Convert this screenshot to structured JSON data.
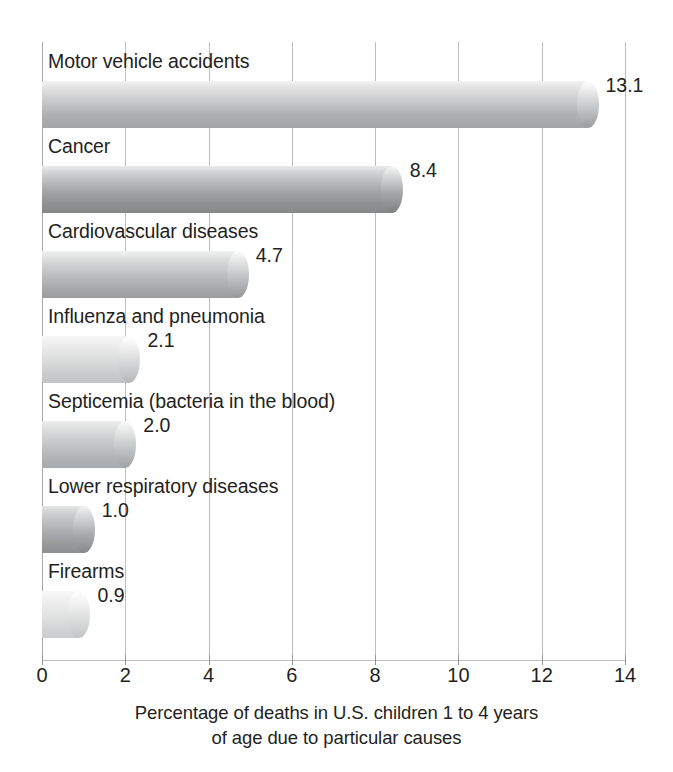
{
  "chart_data": {
    "type": "bar",
    "orientation": "horizontal",
    "title": "",
    "subtitle": "",
    "xlabel_line1": "Percentage of deaths in U.S. children 1 to 4 years",
    "xlabel_line2": "of age due to particular causes",
    "ylabel": "",
    "xlim": [
      0,
      14
    ],
    "xticks": [
      0,
      2,
      4,
      6,
      8,
      10,
      12,
      14
    ],
    "xtick_labels": [
      "0",
      "2",
      "4",
      "6",
      "8",
      "10",
      "12",
      "14"
    ],
    "grid": "vertical",
    "legend": "none",
    "categories": [
      "Motor vehicle accidents",
      "Cancer",
      "Cardiovascular diseases",
      "Influenza and pneumonia",
      "Septicemia (bacteria in the blood)",
      "Lower respiratory diseases",
      "Firearms"
    ],
    "values": [
      13.1,
      8.4,
      4.7,
      2.1,
      2.0,
      1.0,
      0.9
    ],
    "value_labels": [
      "13.1",
      "8.4",
      "4.7",
      "2.1",
      "2.0",
      "1.0",
      "0.9"
    ],
    "bars": [
      {
        "label": "Motor vehicle accidents",
        "value": 13.1,
        "value_label": "13.1",
        "shade": "shade-a"
      },
      {
        "label": "Cancer",
        "value": 8.4,
        "value_label": "8.4",
        "shade": "shade-b"
      },
      {
        "label": "Cardiovascular diseases",
        "value": 4.7,
        "value_label": "4.7",
        "shade": "shade-c"
      },
      {
        "label": "Influenza and pneumonia",
        "value": 2.1,
        "value_label": "2.1",
        "shade": "shade-d"
      },
      {
        "label": "Septicemia (bacteria in the blood)",
        "value": 2.0,
        "value_label": "2.0",
        "shade": "shade-e"
      },
      {
        "label": "Lower respiratory diseases",
        "value": 1.0,
        "value_label": "1.0",
        "shade": "shade-f"
      },
      {
        "label": "Firearms",
        "value": 0.9,
        "value_label": "0.9",
        "shade": "shade-g"
      }
    ],
    "colors": {
      "bar_light": "#f3f3f3",
      "bar_mid": "#c9cacb",
      "bar_dark": "#86888a",
      "gridline": "#bcbec0",
      "text": "#231f20",
      "background": "#ffffff"
    }
  }
}
